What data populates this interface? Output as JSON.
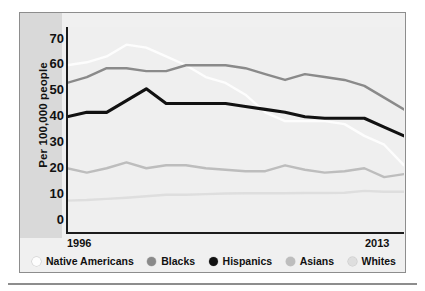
{
  "axis": {
    "y_title": "Per 100,000 people",
    "y_ticks": [
      "70",
      "60",
      "50",
      "40",
      "30",
      "20",
      "10",
      "0"
    ],
    "x_start": "1996",
    "x_end": "2013"
  },
  "legend": {
    "items": [
      {
        "label": "Native Americans",
        "color": "#fdfdfd",
        "marker": "circle-marker"
      },
      {
        "label": "Blacks",
        "color": "#8a8a8a",
        "marker": "circle-marker"
      },
      {
        "label": "Hispanics",
        "color": "#111111",
        "marker": "circle-marker"
      },
      {
        "label": "Asians",
        "color": "#bdbdbd",
        "marker": "circle-marker"
      },
      {
        "label": "Whites",
        "color": "#dedede",
        "marker": "circle-marker"
      }
    ]
  },
  "chart_data": {
    "type": "line",
    "title": "",
    "xlabel": "",
    "ylabel": "Per 100,000 people",
    "xlim": [
      1996,
      2013
    ],
    "ylim": [
      0,
      70
    ],
    "ytick_step": 10,
    "grid": false,
    "legend_position": "bottom",
    "x": [
      1996,
      1997,
      1998,
      1999,
      2000,
      2001,
      2002,
      2003,
      2004,
      2005,
      2006,
      2007,
      2008,
      2009,
      2010,
      2011,
      2012,
      2013
    ],
    "series": [
      {
        "name": "Native Americans",
        "color": "#fdfdfd",
        "values": [
          57,
          58,
          60,
          64,
          63,
          60,
          57,
          53,
          51,
          47,
          41,
          38,
          38,
          38,
          37,
          33,
          30,
          23
        ]
      },
      {
        "name": "Blacks",
        "color": "#8a8a8a",
        "values": [
          51,
          53,
          56,
          56,
          55,
          55,
          57,
          57,
          57,
          56,
          54,
          52,
          54,
          53,
          52,
          50,
          46,
          42
        ]
      },
      {
        "name": "Hispanics",
        "color": "#111111",
        "values": [
          39.5,
          41,
          41,
          45,
          49,
          44,
          44,
          44,
          44,
          43,
          42,
          41,
          39.5,
          39,
          39,
          39,
          36,
          33
        ]
      },
      {
        "name": "Asians",
        "color": "#bdbdbd",
        "values": [
          22,
          20.5,
          22,
          24,
          22,
          23,
          23,
          22,
          21.5,
          21,
          21,
          23,
          21.5,
          20.5,
          21,
          22,
          19,
          20
        ]
      },
      {
        "name": "Whites",
        "color": "#dedede",
        "values": [
          11,
          11.2,
          11.6,
          12,
          12.5,
          13,
          13,
          13.2,
          13.4,
          13.5,
          13.5,
          13.5,
          13.6,
          13.6,
          13.7,
          14.3,
          14,
          14
        ]
      }
    ]
  }
}
